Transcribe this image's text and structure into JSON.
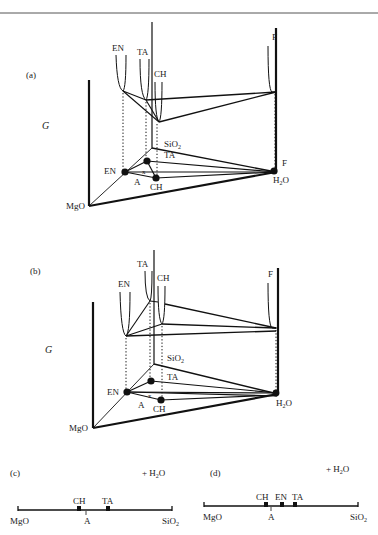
{
  "header_cut_text": "",
  "panel_a": {
    "label": "(a)",
    "axis_label": "G",
    "curve_labels": {
      "EN": "EN",
      "TA": "TA",
      "CH": "CH",
      "F": "F"
    },
    "base_labels": {
      "MgO": "MgO",
      "SiO2": "SiO",
      "SiO2_sub": "2",
      "H2O": "H",
      "H2O_sub": "2",
      "H2O_o": "O",
      "F": "F",
      "EN": "EN",
      "TA": "TA",
      "CH": "CH",
      "A": "A",
      "x": "x"
    }
  },
  "panel_b": {
    "label": "(b)",
    "axis_label": "G",
    "curve_labels": {
      "EN": "EN",
      "TA": "TA",
      "CH": "CH",
      "F": "F"
    },
    "base_labels": {
      "MgO": "MgO",
      "SiO2": "SiO",
      "SiO2_sub": "2",
      "H2O": "H",
      "H2O_sub": "2",
      "H2O_o": "O",
      "EN": "EN",
      "TA": "TA",
      "CH": "CH",
      "A": "A",
      "x": "x"
    }
  },
  "panel_c": {
    "label": "(c)",
    "extra": "+ H",
    "extra_sub": "2",
    "extra_o": "O",
    "left": "MgO",
    "right": "SiO",
    "right_sub": "2",
    "phases": [
      "CH",
      "TA"
    ],
    "point": "A"
  },
  "panel_d": {
    "label": "(d)",
    "extra": "+ H",
    "extra_sub": "2",
    "extra_o": "O",
    "left": "MgO",
    "right": "SiO",
    "right_sub": "2",
    "phases": [
      "CH",
      "EN",
      "TA"
    ],
    "point": "A"
  }
}
